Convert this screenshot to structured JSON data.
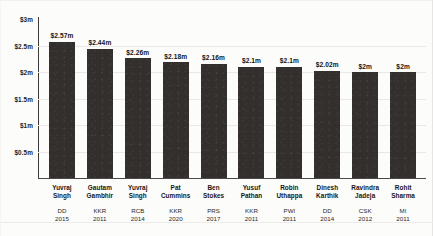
{
  "chart_data": {
    "type": "bar",
    "title": "",
    "xlabel": "",
    "ylabel": "",
    "ylim": [
      0,
      3
    ],
    "grid": true,
    "legend": "none",
    "currency": "USD millions",
    "categories": [
      "Yuvraj Singh",
      "Gautam Gambhir",
      "Yuvraj Singh",
      "Pat Cummins",
      "Ben Stokes",
      "Yusuf Pathan",
      "Robin Uthappa",
      "Dinesh Karthik",
      "Ravindra Jadeja",
      "Rohit Sharma"
    ],
    "values": [
      2.57,
      2.44,
      2.26,
      2.18,
      2.16,
      2.1,
      2.1,
      2.02,
      2.0,
      2.0
    ],
    "value_labels": [
      "$2.57m",
      "$2.44m",
      "$2.26m",
      "$2.18m",
      "$2.16m",
      "$2.1m",
      "$2.1m",
      "$2.02m",
      "$2m",
      "$2m"
    ],
    "ytick_values": [
      3,
      2.5,
      2,
      1.5,
      1,
      0.5
    ],
    "ytick_labels": [
      "$3m",
      "$2.5m",
      "$2m",
      "$1.5m",
      "$1m",
      "$0.5m"
    ],
    "bar_color": "#332f2c",
    "gridline_color": "#e9e8e5",
    "axis_color": "#3b3a38",
    "background_color": "#fcfcfb",
    "points": [
      {
        "name_line1": "Yuvraj",
        "name_line2": "Singh",
        "team": "DD",
        "year": "2015",
        "value_label": "$2.57m",
        "value": 2.57
      },
      {
        "name_line1": "Gautam",
        "name_line2": "Gambhir",
        "team": "KKR",
        "year": "2011",
        "value_label": "$2.44m",
        "value": 2.44
      },
      {
        "name_line1": "Yuvraj",
        "name_line2": "Singh",
        "team": "RCB",
        "year": "2014",
        "value_label": "$2.26m",
        "value": 2.26
      },
      {
        "name_line1": "Pat",
        "name_line2": "Cummins",
        "team": "KKR",
        "year": "2020",
        "value_label": "$2.18m",
        "value": 2.18
      },
      {
        "name_line1": "Ben",
        "name_line2": "Stokes",
        "team": "PRS",
        "year": "2017",
        "value_label": "$2.16m",
        "value": 2.16
      },
      {
        "name_line1": "Yusuf",
        "name_line2": "Pathan",
        "team": "KKR",
        "year": "2011",
        "value_label": "$2.1m",
        "value": 2.1
      },
      {
        "name_line1": "Robin",
        "name_line2": "Uthappa",
        "team": "PWI",
        "year": "2011",
        "value_label": "$2.1m",
        "value": 2.1
      },
      {
        "name_line1": "Dinesh",
        "name_line2": "Karthik",
        "team": "DD",
        "year": "2014",
        "value_label": "$2.02m",
        "value": 2.02
      },
      {
        "name_line1": "Ravindra",
        "name_line2": "Jadeja",
        "team": "CSK",
        "year": "2012",
        "value_label": "$2m",
        "value": 2.0
      },
      {
        "name_line1": "Rohit",
        "name_line2": "Sharma",
        "team": "MI",
        "year": "2011",
        "value_label": "$2m",
        "value": 2.0
      }
    ]
  }
}
